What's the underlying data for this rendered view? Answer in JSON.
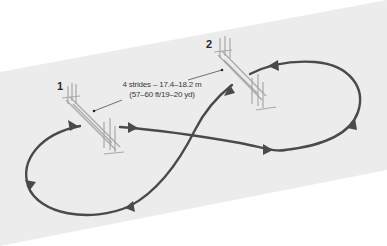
{
  "diagram": {
    "colors": {
      "background": "#ffffff",
      "arena": "#ececec",
      "track": "#4a4a4a",
      "fence": "#a8a8a8",
      "text": "#3a3a3a"
    },
    "fences": [
      {
        "id": "fence-1",
        "label": "1"
      },
      {
        "id": "fence-2",
        "label": "2"
      }
    ],
    "distance_label": {
      "line1": "4 strides – 17.4–18.2 m",
      "line2": "(57–60 ft/19–20 yd)"
    },
    "track": {
      "shape": "figure-eight",
      "direction_arrows": 7
    }
  }
}
